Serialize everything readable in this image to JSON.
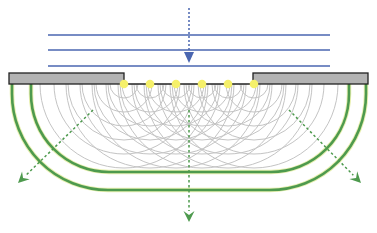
{
  "diagram": {
    "type": "single-slit diffraction (Huygens wavelets)",
    "colors": {
      "incident_wave": "#4a66b0",
      "barrier_fill": "#b3b3b3",
      "barrier_stroke": "#222222",
      "source_point": "#f5f06a",
      "wavelet": "#c4c4c4",
      "wavefront": "#4e9a4e",
      "arrow_green": "#4e9a4e"
    },
    "incident_wavefronts": [
      {
        "y": 35,
        "x1": 48,
        "x2": 330
      },
      {
        "y": 50,
        "x1": 48,
        "x2": 330
      },
      {
        "y": 66,
        "x1": 48,
        "x2": 330
      }
    ],
    "incident_arrow": {
      "x": 189,
      "y1": 8,
      "y2": 63
    },
    "barriers": [
      {
        "name": "left",
        "x": 9,
        "y": 73,
        "w": 115,
        "h": 11
      },
      {
        "name": "right",
        "x": 253,
        "y": 73,
        "w": 115,
        "h": 11
      }
    ],
    "slit": {
      "y": 84,
      "x1": 124,
      "x2": 254
    },
    "sources": [
      124,
      150,
      176,
      202,
      228,
      254
    ],
    "wavelet_radii": [
      14,
      28,
      42,
      56,
      70,
      84
    ],
    "wavefronts_out": [
      {
        "left_x": 31,
        "right_x": 349,
        "bottom_y": 172,
        "corner_r": 78
      },
      {
        "left_x": 12,
        "right_x": 366,
        "bottom_y": 190,
        "corner_r": 96
      }
    ],
    "diffracted_arrows": [
      {
        "x1": 93,
        "y1": 110,
        "x2": 18,
        "y2": 183
      },
      {
        "x1": 189,
        "y1": 110,
        "x2": 189,
        "y2": 222
      },
      {
        "x1": 289,
        "y1": 110,
        "x2": 361,
        "y2": 183
      }
    ]
  }
}
